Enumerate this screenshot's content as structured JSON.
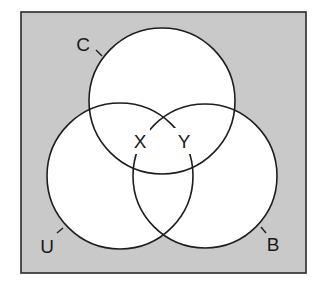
{
  "diagram": {
    "type": "venn",
    "universe": {
      "x": 21,
      "y": 12,
      "width": 285,
      "height": 261,
      "fill": "#c9c9c9",
      "stroke": "#2a2a2a"
    },
    "circles": [
      {
        "id": "C",
        "label": "C",
        "cx": 162,
        "cy": 101,
        "r": 73
      },
      {
        "id": "U",
        "label": "U",
        "cx": 120,
        "cy": 176,
        "r": 73
      },
      {
        "id": "B",
        "label": "B",
        "cx": 205,
        "cy": 176,
        "r": 72
      }
    ],
    "circle_fill": "#ffffff",
    "circle_stroke": "#1e1e1e",
    "set_labels": [
      {
        "text": "C",
        "x": 82,
        "y": 50
      },
      {
        "text": "U",
        "x": 46,
        "y": 256
      },
      {
        "text": "B",
        "x": 272,
        "y": 254
      }
    ],
    "region_labels": [
      {
        "text": "X",
        "x": 140,
        "y": 148
      },
      {
        "text": "Y",
        "x": 184,
        "y": 148
      }
    ]
  }
}
